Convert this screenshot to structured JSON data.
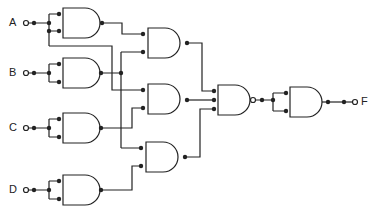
{
  "diagram": {
    "type": "logic-circuit",
    "inputs": [
      {
        "id": "A",
        "label": "A",
        "y": 23
      },
      {
        "id": "B",
        "label": "B",
        "y": 73
      },
      {
        "id": "C",
        "label": "C",
        "y": 128
      },
      {
        "id": "D",
        "label": "D",
        "y": 190
      }
    ],
    "output": {
      "id": "F",
      "label": "F",
      "y": 102
    },
    "gates": [
      {
        "id": "g1",
        "type": "NAND-as-inverter",
        "inputs": [
          "A",
          "A"
        ]
      },
      {
        "id": "g2",
        "type": "NAND-as-inverter",
        "inputs": [
          "B",
          "B"
        ]
      },
      {
        "id": "g3",
        "type": "NAND-as-inverter",
        "inputs": [
          "C",
          "C"
        ]
      },
      {
        "id": "g4",
        "type": "NAND-as-inverter",
        "inputs": [
          "D",
          "D"
        ]
      },
      {
        "id": "g5",
        "type": "AND",
        "inputs": [
          "g1",
          "g2"
        ]
      },
      {
        "id": "g6",
        "type": "AND",
        "inputs": [
          "A",
          "g3"
        ]
      },
      {
        "id": "g7",
        "type": "AND",
        "inputs": [
          "g2",
          "g4"
        ]
      },
      {
        "id": "g8",
        "type": "NAND",
        "inputs": [
          "g5",
          "g6",
          "g7"
        ]
      },
      {
        "id": "g9",
        "type": "NAND-as-inverter",
        "inputs": [
          "g8",
          "g8"
        ],
        "output": "F"
      }
    ],
    "colors": {
      "line": "#222222",
      "background": "#ffffff"
    }
  }
}
